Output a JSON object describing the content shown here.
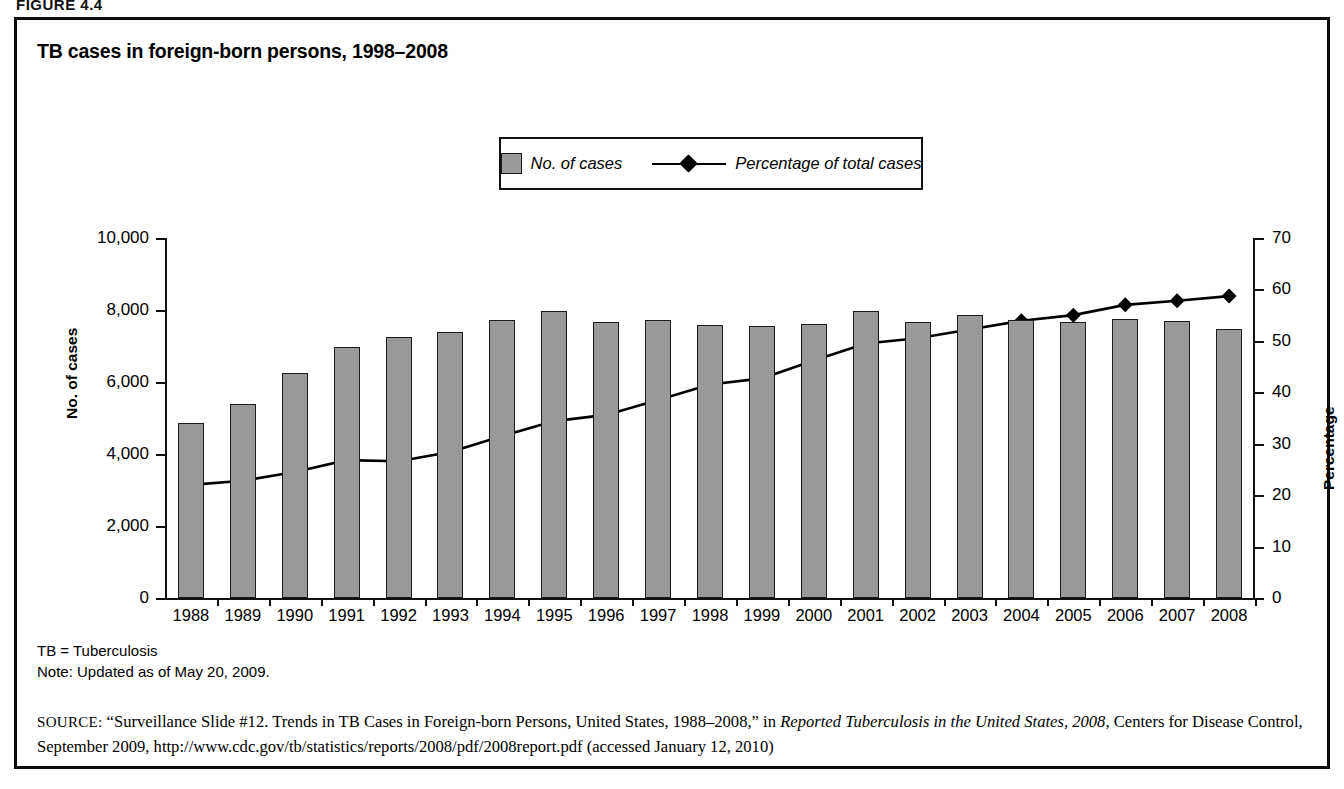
{
  "figure_label": "FIGURE 4.4",
  "chart_title": "TB cases in foreign-born persons, 1998–2008",
  "legend": {
    "bar_label": "No. of cases",
    "line_label": "Percentage of total cases",
    "bar_color": "#9d9d9d",
    "line_color": "#000000"
  },
  "axes": {
    "left_title": "No. of cases",
    "right_title": "Percentage",
    "left_ticks": [
      "0",
      "2,000",
      "4,000",
      "6,000",
      "8,000",
      "10,000"
    ],
    "right_ticks": [
      "0",
      "10",
      "20",
      "30",
      "40",
      "50",
      "60",
      "70"
    ]
  },
  "notes": {
    "abbrev": "TB = Tuberculosis",
    "note": "Note: Updated as of May 20, 2009."
  },
  "source": {
    "label": "SOURCE:",
    "part1": "“Surveillance Slide #12. Trends in TB Cases in Foreign-born Persons, United States, 1988–2008,” in ",
    "italic1": "Reported Tuberculosis in the United States,",
    "italic2": "2008",
    "part2": ", Centers for Disease Control, September 2009, http://www.cdc.gov/tb/statistics/reports/2008/pdf/2008report.pdf (accessed January 12, 2010)"
  },
  "chart_data": {
    "type": "bar",
    "title": "TB cases in foreign-born persons, 1998–2008",
    "xlabel": "",
    "ylabel": "No. of cases",
    "y2label": "Percentage",
    "ylim": [
      0,
      10000
    ],
    "y2lim": [
      0,
      70
    ],
    "grid": false,
    "legend_position": "top-center",
    "categories": [
      "1988",
      "1989",
      "1990",
      "1991",
      "1992",
      "1993",
      "1994",
      "1995",
      "1996",
      "1997",
      "1998",
      "1999",
      "2000",
      "2001",
      "2002",
      "2003",
      "2004",
      "2005",
      "2006",
      "2007",
      "2008"
    ],
    "series": [
      {
        "name": "No. of cases",
        "type": "bar",
        "axis": "left",
        "values": [
          4850,
          5400,
          6250,
          6980,
          7250,
          7380,
          7720,
          7980,
          7680,
          7720,
          7570,
          7560,
          7600,
          7960,
          7660,
          7860,
          7720,
          7680,
          7750,
          7690,
          7470
        ]
      },
      {
        "name": "Percentage of total cases",
        "type": "line",
        "axis": "right",
        "values": [
          22.0,
          22.8,
          24.5,
          26.8,
          26.6,
          28.4,
          31.5,
          34.4,
          35.6,
          38.5,
          41.5,
          42.7,
          46.2,
          49.5,
          50.5,
          52.2,
          53.9,
          55.0,
          57.0,
          57.8,
          58.7
        ]
      }
    ]
  }
}
